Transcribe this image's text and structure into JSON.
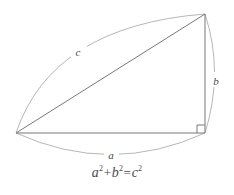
{
  "figure": {
    "background_color": "#ffffff",
    "line_color": "#8a8a8a",
    "triangle_color": "#6e6e6e",
    "arc_color": "#9a9a9a",
    "text_color": "#4a4a4a"
  },
  "triangle": {
    "vertices": {
      "left": {
        "x": 16,
        "y": 133
      },
      "top": {
        "x": 205,
        "y": 14
      },
      "right_angle": {
        "x": 205,
        "y": 133
      }
    },
    "right_angle_marker": {
      "present": true,
      "size": 8
    },
    "sides": [
      {
        "id": "a",
        "name": "base",
        "from": "left",
        "to": "right_angle"
      },
      {
        "id": "b",
        "name": "height",
        "from": "top",
        "to": "right_angle"
      },
      {
        "id": "c",
        "name": "hypotenuse",
        "from": "left",
        "to": "top"
      }
    ]
  },
  "labels": {
    "a": {
      "text": "a",
      "x": 111,
      "y": 156
    },
    "b": {
      "text": "b",
      "x": 216,
      "y": 81
    },
    "c": {
      "text": "c",
      "x": 78,
      "y": 53
    }
  },
  "arcs": [
    {
      "id": "arc-a",
      "label": "a",
      "from": "left",
      "to": "right_angle",
      "bulge": "outward-down"
    },
    {
      "id": "arc-b",
      "label": "b",
      "from": "top",
      "to": "right_angle",
      "bulge": "outward-right"
    },
    {
      "id": "arc-c",
      "label": "c",
      "from": "left",
      "to": "top",
      "bulge": "outward-up-left"
    }
  ],
  "equation": {
    "full_text": "a² + b² = c²",
    "term_a": "a",
    "exp_a": "2",
    "operator_plus": "+",
    "term_b": "b",
    "exp_b": "2",
    "operator_equals": "=",
    "term_c": "c",
    "exp_c": "2"
  }
}
